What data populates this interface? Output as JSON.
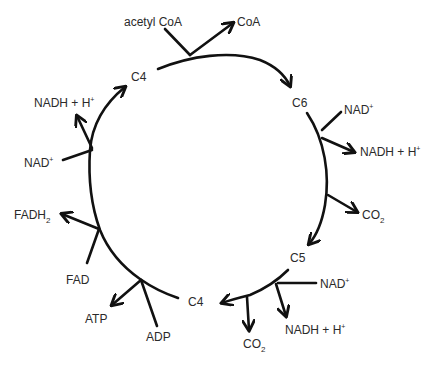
{
  "diagram": {
    "nodes": {
      "c4_top": "C4",
      "c6": "C6",
      "c5": "C5",
      "c4_bottom": "C4"
    },
    "labels": {
      "acetyl_coa": "acetyl CoA",
      "coa": "CoA",
      "nad_1": "NAD",
      "nadh_1": "NADH + H",
      "co2_1": "CO",
      "nad_2": "NAD",
      "nadh_2": "NADH + H",
      "co2_2": "CO",
      "adp": "ADP",
      "atp": "ATP",
      "fad": "FAD",
      "fadh2": "FADH",
      "nad_3": "NAD",
      "nadh_3": "NADH + H"
    },
    "superscripts": {
      "plus": "+"
    },
    "subscripts": {
      "two": "2"
    },
    "colors": {
      "stroke": "#111111",
      "text": "#2a2a2a",
      "background": "#ffffff"
    }
  }
}
